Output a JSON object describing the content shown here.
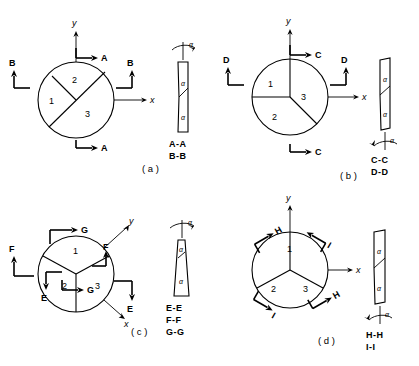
{
  "figure": {
    "type": "engineering-section-diagram",
    "background": "#ffffff",
    "line_color": "#000000",
    "panels": [
      {
        "id": "a",
        "caption": "( a )",
        "sector_labels": [
          "1",
          "2",
          "3"
        ],
        "axes": [
          "y",
          "x"
        ],
        "section_marks": [
          "A",
          "A",
          "B",
          "B"
        ],
        "section_titles": [
          "A-A",
          "B-B"
        ],
        "angle_symbol": "α",
        "angle_marker_position": "top",
        "division_style": "chord-and-segment",
        "bar_style": "slender-curved"
      },
      {
        "id": "b",
        "caption": "( b )",
        "sector_labels": [
          "1",
          "2",
          "3"
        ],
        "axes": [
          "y",
          "x"
        ],
        "section_marks": [
          "C",
          "C",
          "D",
          "D"
        ],
        "section_titles": [
          "C-C",
          "D-D"
        ],
        "angle_symbol": "α",
        "angle_marker_position": "bottom",
        "division_style": "tri-radial-rotated",
        "bar_style": "slender-curved"
      },
      {
        "id": "c",
        "caption": "( c )",
        "sector_labels": [
          "1",
          "2",
          "3"
        ],
        "axes": [
          "y",
          "x"
        ],
        "section_marks": [
          "E",
          "E",
          "F",
          "F",
          "G",
          "G"
        ],
        "section_titles": [
          "E-E",
          "F-F",
          "G-G"
        ],
        "angle_symbol": "α",
        "angle_marker_position": "top",
        "division_style": "inverted-tri-radial",
        "bar_style": "tapered-wedge"
      },
      {
        "id": "d",
        "caption": "( d )",
        "sector_labels": [
          "1",
          "2",
          "3"
        ],
        "axes": [
          "y",
          "x"
        ],
        "section_marks": [
          "H",
          "H",
          "I",
          "I"
        ],
        "section_titles": [
          "H-H",
          "I-I"
        ],
        "angle_symbol": "α",
        "angle_marker_position": "bottom",
        "division_style": "tri-radial",
        "bar_style": "slender-curved"
      }
    ]
  }
}
